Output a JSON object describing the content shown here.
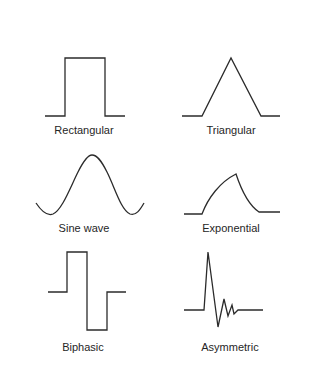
{
  "diagram": {
    "stroke_color": "#2b2b2b",
    "label_color": "#262626",
    "background": "#ffffff",
    "waveforms": [
      {
        "id": "rectangular",
        "label": "Rectangular",
        "label_pos": {
          "x": 84,
          "y": 124
        },
        "path": "M45,116 L65,116 L65,58 L105,58 L105,116 L125,116"
      },
      {
        "id": "triangular",
        "label": "Triangular",
        "label_pos": {
          "x": 231,
          "y": 124
        },
        "path": "M182,116 L202,116 L231,58 L261,116 L280,116"
      },
      {
        "id": "sine-wave",
        "label": "Sine wave",
        "label_pos": {
          "x": 84,
          "y": 222
        },
        "path": "M36,203 C42,212 48,216 53,214 C62,210 70,188 78,172 C84,160 88,155 92,155 C97,155 101,160 107,172 C115,188 121,210 130,214 C136,216 140,210 144,203"
      },
      {
        "id": "exponential",
        "label": "Exponential",
        "label_pos": {
          "x": 231,
          "y": 222
        },
        "path": "M184,214 L202,214 C208,198 220,182 236,174 C242,192 250,206 259,212 L280,212"
      },
      {
        "id": "biphasic",
        "label": "Biphasic",
        "label_pos": {
          "x": 83,
          "y": 341
        },
        "path": "M48,292 L67,292 L67,252 L87,252 L87,330 L107,330 L107,292 L126,292"
      },
      {
        "id": "asymmetric",
        "label": "Asymmetric",
        "label_pos": {
          "x": 230,
          "y": 341
        },
        "path": "M184,310 L204,310 L208,252 L218,327 L224,299 L228,316 L232,305 L234,314 L238,310 L263,310"
      }
    ]
  }
}
